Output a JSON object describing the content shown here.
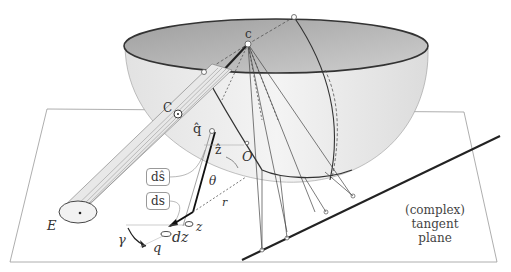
{
  "diagram": {
    "labels": {
      "c_top": "c",
      "C_point": "C",
      "q_hat": "q̂",
      "z_hat": "ẑ",
      "O": "O",
      "theta": "θ",
      "r": "r",
      "E": "E",
      "gamma": "γ",
      "q": "q",
      "dz": "dz",
      "z": "z",
      "ds_hat": "dŝ",
      "ds": "ds"
    },
    "plane_caption": {
      "line1": "(complex)",
      "line2": "tangent plane"
    },
    "colors": {
      "bowl_inside": "#b8b8b8",
      "bowl_outside": "#ececec",
      "plane": "#ffffff",
      "stroke": "#333333"
    }
  }
}
